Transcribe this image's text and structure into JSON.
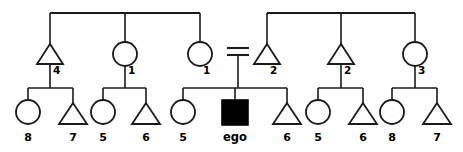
{
  "diagram": {
    "type": "pedigree",
    "colors": {
      "line": "#1a1a1a",
      "open_fill": "#ffffff",
      "ego_fill": "#000000",
      "background": "#ffffff"
    },
    "ego_label": "ego",
    "union_symbol": "=",
    "generation1": {
      "sibling_bar_left": {
        "x1": 50,
        "x2": 200,
        "y": 13
      },
      "sibling_bar_right": {
        "x1": 267,
        "x2": 415,
        "y": 13
      }
    },
    "generation2": [
      {
        "id": "g2-a",
        "shape": "triangle",
        "label": "4",
        "cx": 50,
        "filled": false
      },
      {
        "id": "g2-b",
        "shape": "circle",
        "label": "1",
        "cx": 125,
        "filled": false
      },
      {
        "id": "g2-c",
        "shape": "circle",
        "label": "1",
        "cx": 200,
        "filled": false
      },
      {
        "id": "g2-d",
        "shape": "triangle",
        "label": "2",
        "cx": 267,
        "filled": false
      },
      {
        "id": "g2-e",
        "shape": "triangle",
        "label": "2",
        "cx": 341,
        "filled": false
      },
      {
        "id": "g2-f",
        "shape": "circle",
        "label": "3",
        "cx": 415,
        "filled": false
      }
    ],
    "generation3": [
      {
        "id": "g3-1",
        "shape": "circle",
        "label": "8",
        "cx": 28,
        "filled": false,
        "parent": "g2-a"
      },
      {
        "id": "g3-2",
        "shape": "triangle",
        "label": "7",
        "cx": 73,
        "filled": false,
        "parent": "g2-a"
      },
      {
        "id": "g3-3",
        "shape": "circle",
        "label": "5",
        "cx": 103,
        "filled": false,
        "parent": "g2-b"
      },
      {
        "id": "g3-4",
        "shape": "triangle",
        "label": "6",
        "cx": 146,
        "filled": false,
        "parent": "g2-b"
      },
      {
        "id": "g3-5",
        "shape": "circle",
        "label": "5",
        "cx": 183,
        "filled": false,
        "parent": "union"
      },
      {
        "id": "g3-6",
        "shape": "square",
        "label": "ego",
        "cx": 235,
        "filled": true,
        "parent": "union"
      },
      {
        "id": "g3-7",
        "shape": "triangle",
        "label": "6",
        "cx": 287,
        "filled": false,
        "parent": "union"
      },
      {
        "id": "g3-8",
        "shape": "circle",
        "label": "5",
        "cx": 318,
        "filled": false,
        "parent": "g2-e"
      },
      {
        "id": "g3-9",
        "shape": "triangle",
        "label": "6",
        "cx": 363,
        "filled": false,
        "parent": "g2-e"
      },
      {
        "id": "g3-10",
        "shape": "circle",
        "label": "8",
        "cx": 392,
        "filled": false,
        "parent": "g2-f"
      },
      {
        "id": "g3-11",
        "shape": "triangle",
        "label": "7",
        "cx": 437,
        "filled": false,
        "parent": "g2-f"
      }
    ],
    "union": {
      "left_partner": "g2-c",
      "right_partner": "g2-d",
      "marriage_bar_top_y": 48,
      "marriage_bar_bottom_y": 55,
      "marriage_bar_x1": 228,
      "marriage_bar_x2": 249,
      "descent_x": 235
    }
  }
}
